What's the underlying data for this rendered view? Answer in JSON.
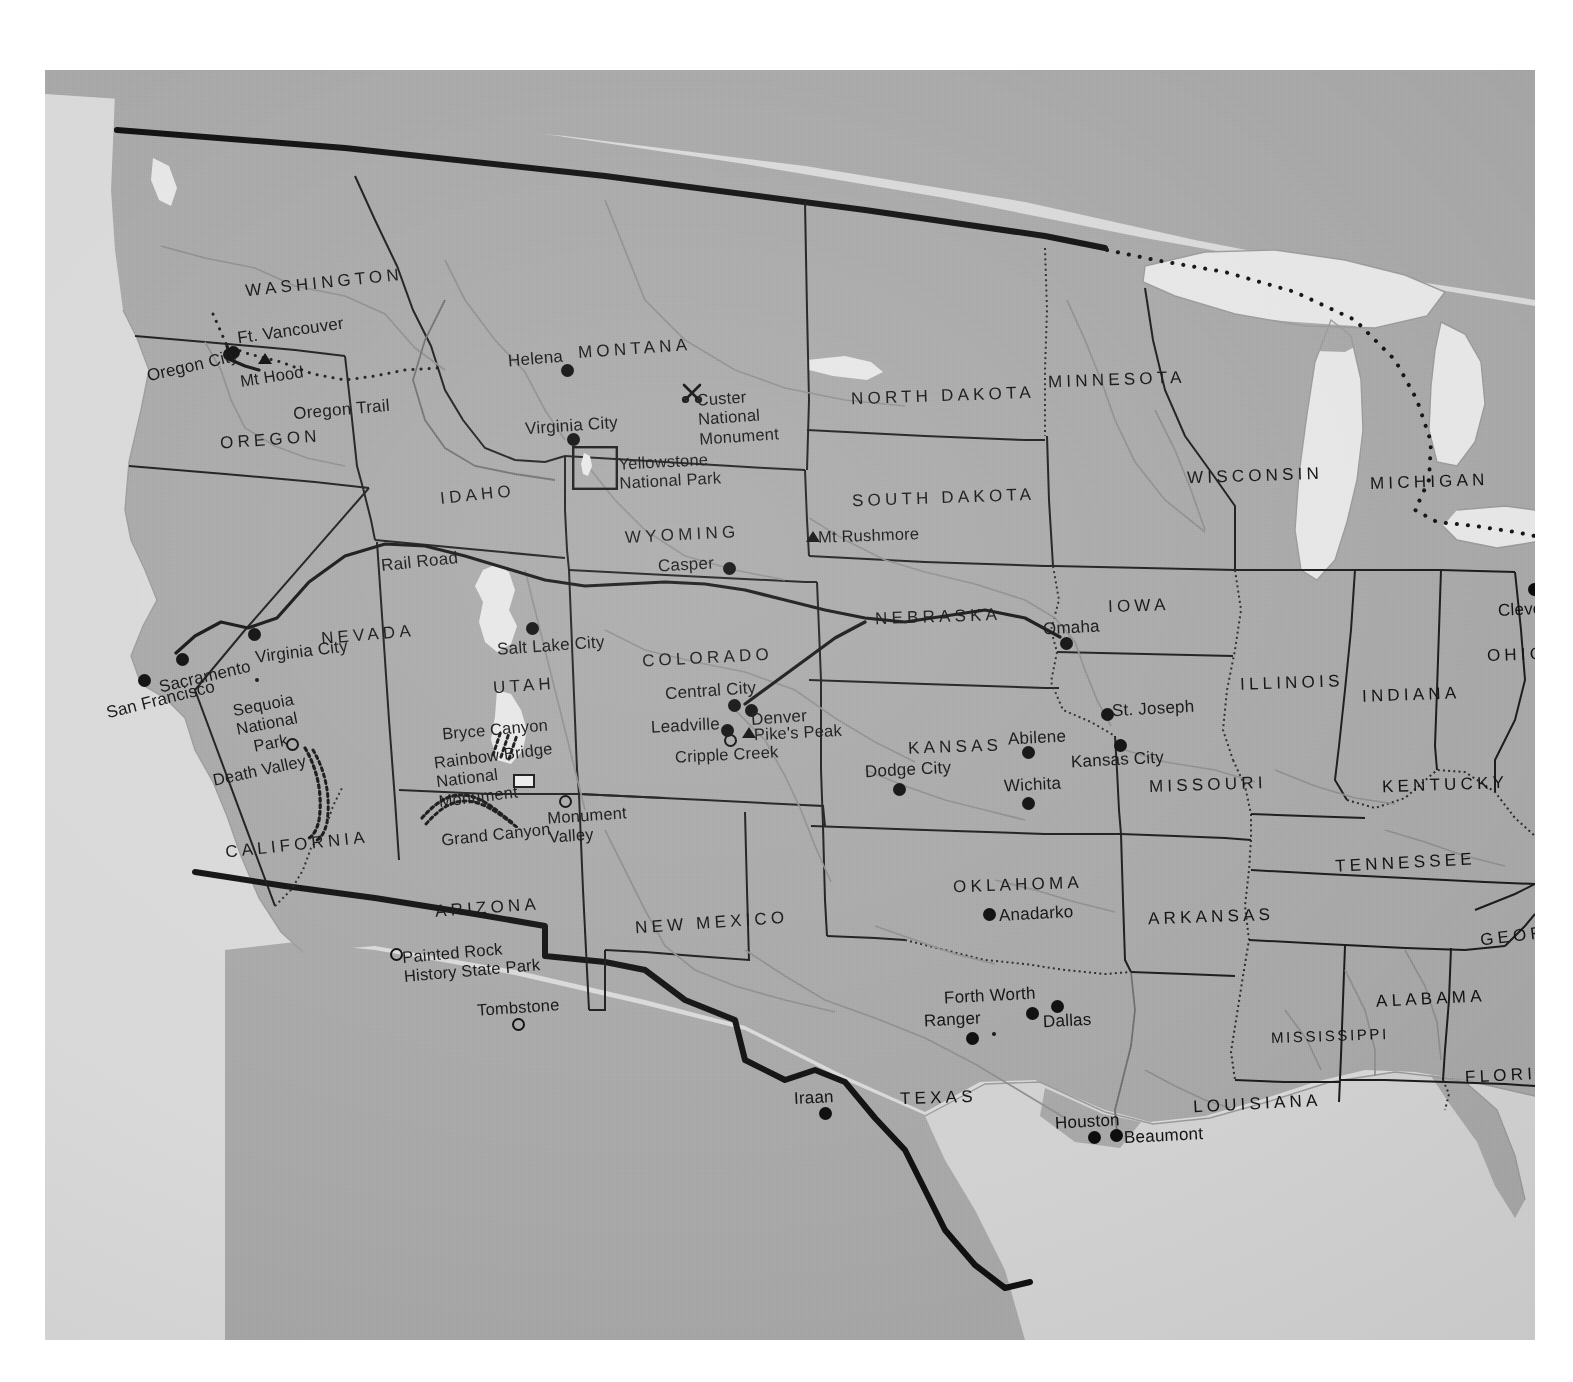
{
  "figure": {
    "kind": "historical-reference-map",
    "background_color": "#ffffff",
    "plate_color": "#b6b6b6",
    "land_color": "#a8a8a8",
    "water_color": "#d9d9d9",
    "ink_color": "#121212"
  },
  "states": [
    {
      "name": "WASHINGTON",
      "x": 200,
      "y": 203,
      "size": "lg",
      "rotate": -6
    },
    {
      "name": "OREGON",
      "x": 175,
      "y": 360,
      "size": "lg",
      "rotate": -4
    },
    {
      "name": "IDAHO",
      "x": 395,
      "y": 415,
      "size": "lg",
      "rotate": -6
    },
    {
      "name": "MONTANA",
      "x": 533,
      "y": 269,
      "size": "lg",
      "rotate": -4
    },
    {
      "name": "WYOMING",
      "x": 580,
      "y": 455,
      "size": "lg",
      "rotate": -3
    },
    {
      "name": "NORTH DAKOTA",
      "x": 806,
      "y": 316,
      "size": "lg",
      "rotate": -2
    },
    {
      "name": "SOUTH DAKOTA",
      "x": 807,
      "y": 418,
      "size": "lg",
      "rotate": -2
    },
    {
      "name": "MINNESOTA",
      "x": 1003,
      "y": 300,
      "size": "lg",
      "rotate": -2
    },
    {
      "name": "WISCONSIN",
      "x": 1142,
      "y": 396,
      "size": "lg",
      "rotate": -2
    },
    {
      "name": "MICHIGAN",
      "x": 1325,
      "y": 402,
      "size": "lg",
      "rotate": -2
    },
    {
      "name": "IOWA",
      "x": 1063,
      "y": 526,
      "size": "lg",
      "rotate": -2
    },
    {
      "name": "NEBRASKA",
      "x": 830,
      "y": 537,
      "size": "lg",
      "rotate": -2
    },
    {
      "name": "NEVADA",
      "x": 276,
      "y": 555,
      "size": "lg",
      "rotate": -5
    },
    {
      "name": "UTAH",
      "x": 448,
      "y": 606,
      "size": "lg",
      "rotate": -4
    },
    {
      "name": "COLORADO",
      "x": 597,
      "y": 578,
      "size": "lg",
      "rotate": -3
    },
    {
      "name": "KANSAS",
      "x": 863,
      "y": 667,
      "size": "lg",
      "rotate": -2
    },
    {
      "name": "MISSOURI",
      "x": 1104,
      "y": 705,
      "size": "lg",
      "rotate": -2
    },
    {
      "name": "ILLINOIS",
      "x": 1195,
      "y": 603,
      "size": "lg",
      "rotate": -2
    },
    {
      "name": "INDIANA",
      "x": 1317,
      "y": 615,
      "size": "lg",
      "rotate": -2
    },
    {
      "name": "OHIO",
      "x": 1442,
      "y": 575,
      "size": "lg",
      "rotate": -2
    },
    {
      "name": "KENTUCKY",
      "x": 1337,
      "y": 705,
      "size": "lg",
      "rotate": -2
    },
    {
      "name": "TENNESSEE",
      "x": 1290,
      "y": 783,
      "size": "lg",
      "rotate": -3
    },
    {
      "name": "CALIFORNIA",
      "x": 180,
      "y": 765,
      "size": "lg",
      "rotate": -6
    },
    {
      "name": "ARIZONA",
      "x": 390,
      "y": 828,
      "size": "lg",
      "rotate": -4
    },
    {
      "name": "NEW MEXICO",
      "x": 590,
      "y": 843,
      "size": "lg",
      "rotate": -4
    },
    {
      "name": "OKLAHOMA",
      "x": 908,
      "y": 805,
      "size": "lg",
      "rotate": -2
    },
    {
      "name": "ARKANSAS",
      "x": 1103,
      "y": 837,
      "size": "lg",
      "rotate": -2
    },
    {
      "name": "GEORGIA",
      "x": 1435,
      "y": 854,
      "size": "lg",
      "rotate": -7
    },
    {
      "name": "ALABAMA",
      "x": 1331,
      "y": 919,
      "size": "lg",
      "rotate": -3
    },
    {
      "name": "MISSISSIPPI",
      "x": 1226,
      "y": 958,
      "size": "sm",
      "rotate": -2
    },
    {
      "name": "FLORIDA",
      "x": 1420,
      "y": 995,
      "size": "lg",
      "rotate": -3
    },
    {
      "name": "LOUISIANA",
      "x": 1148,
      "y": 1024,
      "size": "lg",
      "rotate": -3
    },
    {
      "name": "TEXAS",
      "x": 855,
      "y": 1018,
      "size": "lg",
      "rotate": -2
    }
  ],
  "cities": [
    {
      "name": "Ft. Vancouver",
      "lx": 192,
      "ly": 251,
      "mx": 182,
      "my": 276,
      "marker": "dot"
    },
    {
      "name": "Oregon City",
      "lx": 101,
      "ly": 286,
      "mx": 178,
      "my": 278,
      "marker": "dot"
    },
    {
      "name": "Helena",
      "lx": 463,
      "ly": 279,
      "mx": 516,
      "my": 294,
      "marker": "dot"
    },
    {
      "name": "Virginia City",
      "lx": 480,
      "ly": 346,
      "mx": 522,
      "my": 363,
      "marker": "dot"
    },
    {
      "name": "Casper",
      "lx": 613,
      "ly": 485,
      "mx": 678,
      "my": 492,
      "marker": "dot"
    },
    {
      "name": "Salt Lake City",
      "lx": 452,
      "ly": 566,
      "mx": 481,
      "my": 552,
      "marker": "dot"
    },
    {
      "name": "Sacramento",
      "lx": 113,
      "ly": 597,
      "mx": 131,
      "my": 583,
      "marker": "dot"
    },
    {
      "name": "San Francisco",
      "lx": 60,
      "ly": 620,
      "mx": 93,
      "my": 604,
      "marker": "dot"
    },
    {
      "name": "Virginia City",
      "lx": 210,
      "ly": 572,
      "mx": 203,
      "my": 558,
      "marker": "dot"
    },
    {
      "name": "Central City",
      "lx": 620,
      "ly": 611,
      "mx": 683,
      "my": 629,
      "marker": "dot"
    },
    {
      "name": "Denver",
      "lx": 706,
      "ly": 638,
      "mx": 700,
      "my": 634,
      "marker": "dot"
    },
    {
      "name": "Leadville",
      "lx": 606,
      "ly": 646,
      "mx": 676,
      "my": 654,
      "marker": "dot"
    },
    {
      "name": "Omaha",
      "lx": 998,
      "ly": 553,
      "mx": 1015,
      "my": 567,
      "marker": "dot"
    },
    {
      "name": "St. Joseph",
      "lx": 1065,
      "ly": 629,
      "mx": 1056,
      "my": 638,
      "marker": "dot"
    },
    {
      "name": "Kansas City",
      "lx": 1026,
      "ly": 680,
      "mx": 1069,
      "my": 669,
      "marker": "dot"
    },
    {
      "name": "Abilene",
      "lx": 963,
      "ly": 662,
      "mx": 977,
      "my": 676,
      "marker": "dot"
    },
    {
      "name": "Dodge City",
      "lx": 820,
      "ly": 694,
      "mx": 848,
      "my": 713,
      "marker": "dot"
    },
    {
      "name": "Wichita",
      "lx": 959,
      "ly": 708,
      "mx": 977,
      "my": 727,
      "marker": "dot"
    },
    {
      "name": "Cleveland",
      "lx": 1457,
      "ly": 530,
      "mx": 1483,
      "my": 513,
      "marker": "dot"
    },
    {
      "name": "Anadarko",
      "lx": 952,
      "ly": 836,
      "mx": 938,
      "my": 838,
      "marker": "dot"
    },
    {
      "name": "Forth Worth",
      "lx": 899,
      "ly": 919,
      "mx": 981,
      "my": 937,
      "marker": "dot"
    },
    {
      "name": "Ranger",
      "lx": 879,
      "ly": 943,
      "mx": 921,
      "my": 962,
      "marker": "dot"
    },
    {
      "name": "Dallas",
      "lx": 997,
      "ly": 944,
      "mx": 1006,
      "my": 930,
      "marker": "dot"
    },
    {
      "name": "Iraan",
      "lx": 749,
      "ly": 1022,
      "mx": 774,
      "my": 1037,
      "marker": "dot"
    },
    {
      "name": "Houston",
      "lx": 1010,
      "ly": 1046,
      "mx": 1043,
      "my": 1061,
      "marker": "dot"
    },
    {
      "name": "Beaumont",
      "lx": 1079,
      "ly": 1060,
      "mx": 1065,
      "my": 1059,
      "marker": "dot"
    }
  ],
  "sites": [
    {
      "name": "Mt. Hood",
      "display": "Mt Hood",
      "lx": 195,
      "ly": 297,
      "mx": 213,
      "my": 283,
      "marker": "triangle"
    },
    {
      "name": "Mt. Rushmore",
      "display": "Mt Rushmore",
      "lx": 771,
      "ly": 459,
      "mx": 761,
      "my": 460,
      "marker": "triangle"
    },
    {
      "name": "Pike's Peak",
      "display": "Pike's Peak",
      "lx": 707,
      "ly": 655,
      "mx": 697,
      "my": 657,
      "marker": "triangle"
    },
    {
      "name": "Cripple Creek",
      "display": "Cripple Creek",
      "lx": 630,
      "ly": 678,
      "mx": 685,
      "my": 667,
      "marker": "open-circle"
    },
    {
      "name": "Monument Valley",
      "display": "Monument\nValley",
      "lx": 503,
      "ly": 735,
      "mx": 516,
      "my": 727,
      "marker": "open-circle"
    },
    {
      "name": "Tombstone",
      "display": "Tombstone",
      "lx": 432,
      "ly": 931,
      "mx": 469,
      "my": 949,
      "marker": "open-circle"
    },
    {
      "name": "Painted Rock History State Park",
      "display": "Painted Rock\nHistory State Park",
      "lx": 355,
      "ly": 874,
      "mx": 345,
      "my": 879,
      "marker": "open-circle"
    },
    {
      "name": "Sequoia National Park",
      "display": "Sequoia\nNational\nPark",
      "lx": 190,
      "ly": 628,
      "mx": 241,
      "my": 671,
      "marker": "open-circle"
    },
    {
      "name": "Custer National Monument",
      "display": "Custer\nNational\nMonument",
      "lx": 652,
      "ly": 320,
      "mx": 641,
      "my": 321,
      "marker": "sabers"
    },
    {
      "name": "Yellowstone National Park",
      "display": "Yellowstone\nNational Park",
      "lx": 572,
      "ly": 386,
      "mx": 547,
      "my": 394,
      "marker": "park-box"
    },
    {
      "name": "Rainbow Bridge National Monument",
      "display": "Rainbow Bridge\nNational\nMonument",
      "lx": 392,
      "ly": 679,
      "mx": 476,
      "my": 711,
      "marker": "park-box"
    },
    {
      "name": "Bryce Canyon",
      "display": "Bryce Canyon",
      "lx": 397,
      "ly": 653,
      "mx": 0,
      "my": 0,
      "marker": "none"
    },
    {
      "name": "Grand Canyon",
      "display": "Grand Canyon",
      "lx": 396,
      "ly": 758,
      "mx": 0,
      "my": 0,
      "marker": "none"
    },
    {
      "name": "Death Valley",
      "display": "Death  Valley",
      "lx": 167,
      "ly": 694,
      "mx": 0,
      "my": 0,
      "marker": "none"
    }
  ],
  "routes": [
    {
      "name": "Oregon Trail",
      "lx": 248,
      "ly": 332,
      "rotate": -5,
      "style": "dotted"
    },
    {
      "name": "Rail Road",
      "lx": 336,
      "ly": 484,
      "rotate": -6,
      "style": "solid"
    }
  ],
  "marker_legend": {
    "dot": "filled circle = city",
    "triangle": "triangle = mountain peak",
    "open-circle": "open circle = historic site / park",
    "sabers": "crossed sabers = battlefield national monument",
    "park-box": "outlined rectangle = national park boundary"
  }
}
